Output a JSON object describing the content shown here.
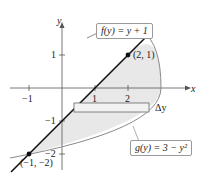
{
  "diagram": {
    "type": "area-between-curves",
    "axes": {
      "x_label": "x",
      "y_label": "y",
      "x_ticks": [
        "−1",
        "1",
        "2"
      ],
      "y_ticks": [
        "1",
        "−1",
        "−2"
      ]
    },
    "curves": [
      {
        "name": "f",
        "label": "f(y) = y + 1",
        "expression": "x = y + 1"
      },
      {
        "name": "g",
        "label": "g(y) = 3 − y²",
        "expression": "x = 3 − y²"
      }
    ],
    "points": [
      {
        "label": "(2, 1)",
        "x": 2,
        "y": 1
      },
      {
        "label": "(−1, −2)",
        "x": -1,
        "y": -2
      }
    ],
    "rectangle_label": "Δy",
    "colors": {
      "region": "#e6e6e6",
      "line": "#111111",
      "parabola": "#8a8a8a"
    }
  }
}
